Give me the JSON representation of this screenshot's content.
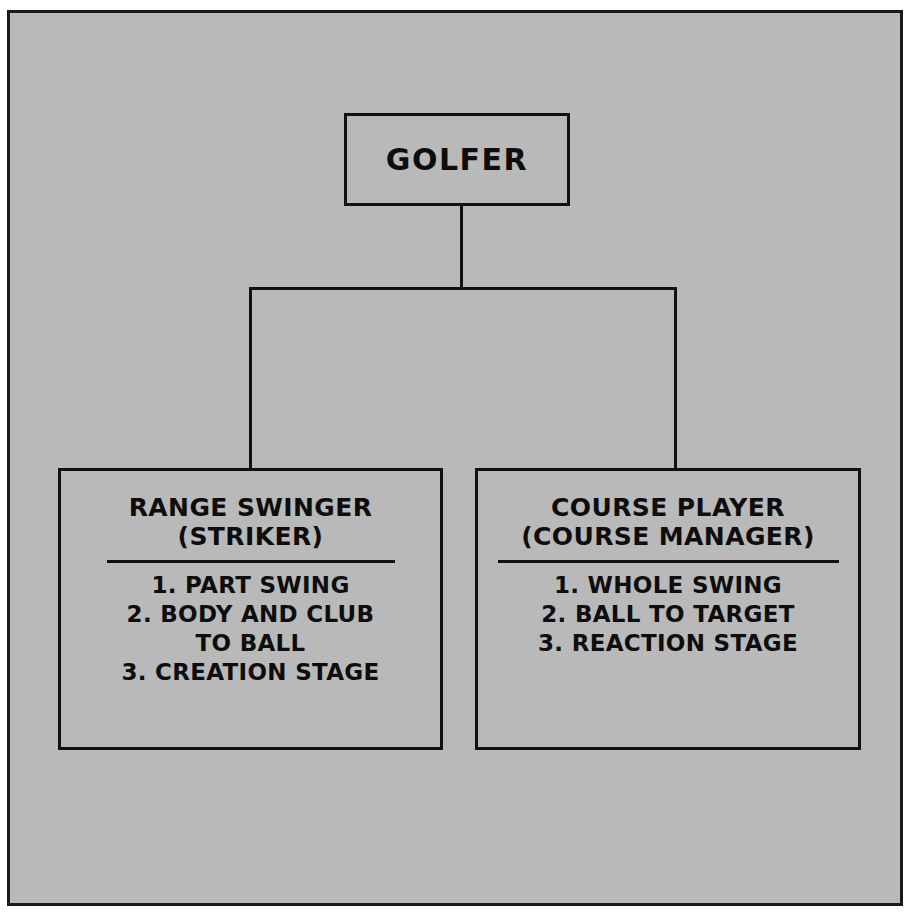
{
  "diagram": {
    "type": "hierarchy-tree",
    "background_color": "#b9b9b9",
    "line_color": "#111111",
    "text_color": "#0d0d0d",
    "root": {
      "title": "GOLFER"
    },
    "children": [
      {
        "id": "range-swinger",
        "title": "RANGE SWINGER",
        "subtitle": "(STRIKER)",
        "items": [
          "1. PART SWING",
          "2. BODY AND CLUB",
          "TO BALL",
          "3. CREATION STAGE"
        ]
      },
      {
        "id": "course-player",
        "title": "COURSE PLAYER",
        "subtitle": "(COURSE MANAGER)",
        "items": [
          "1. WHOLE SWING",
          "2. BALL TO TARGET",
          "3. REACTION STAGE"
        ]
      }
    ]
  }
}
